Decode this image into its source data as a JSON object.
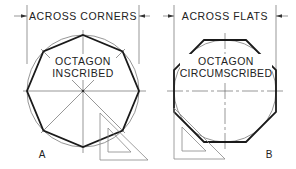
{
  "figure": {
    "colors": {
      "outline": "#1a1a1a",
      "construction": "#6a6a6a",
      "text": "#222222",
      "background": "#ffffff"
    }
  },
  "panel_a": {
    "dimension_label": "ACROSS CORNERS",
    "title_line1": "OCTAGON",
    "title_line2": "INSCRIBED",
    "letter": "A"
  },
  "panel_b": {
    "dimension_label": "ACROSS FLATS",
    "title_line1": "OCTAGON",
    "title_line2": "CIRCUMSCRIBED",
    "letter": "B"
  }
}
